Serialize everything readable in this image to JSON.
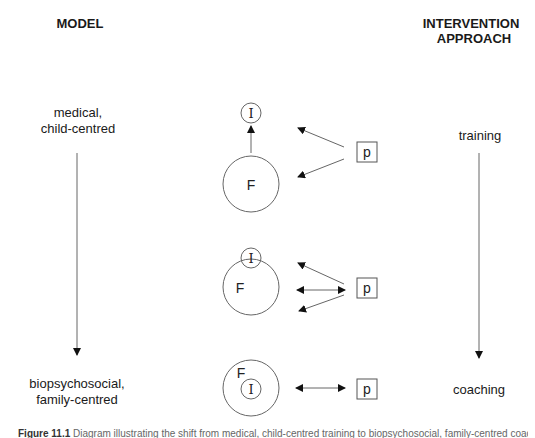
{
  "headers": {
    "left": "MODEL",
    "right_line1": "INTERVENTION",
    "right_line2": "APPROACH"
  },
  "model": {
    "top_line1": "medical,",
    "top_line2": "child-centred",
    "bottom_line1": "biopsychosocial,",
    "bottom_line2": "family-centred"
  },
  "approach": {
    "top": "training",
    "bottom": "coaching"
  },
  "nodes": {
    "intervention_label": "I",
    "family_label": "F",
    "professional_label": "p"
  },
  "rows": [
    {
      "name": "training-configuration",
      "arrows": "p points separately to I and F; F points up to I"
    },
    {
      "name": "intermediate-configuration",
      "arrows": "p points to I, bidirectional with F, and to F"
    },
    {
      "name": "coaching-configuration",
      "arrows": "bidirectional between p and F containing I"
    }
  ],
  "caption": {
    "label": "Figure 11.1",
    "text": "Diagram illustrating the shift from medical, child-centred training to biopsychosocial, family-centred coaching"
  },
  "colors": {
    "stroke": "#555555",
    "arrowhead": "#111111",
    "text": "#1a1a1a"
  }
}
